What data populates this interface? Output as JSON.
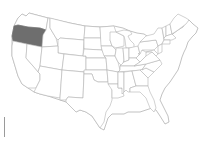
{
  "map": {
    "region": "United States",
    "highlighted_state": "Oregon",
    "colors": {
      "highlight": "#6e6e6e",
      "state_fill": "#ffffff",
      "state_border": "#b4b4b4",
      "background": "#ffffff"
    }
  }
}
